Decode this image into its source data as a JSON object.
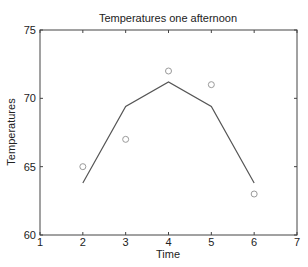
{
  "chart_data": {
    "type": "line",
    "title": "Temperatures one afternoon",
    "xlabel": "Time",
    "ylabel": "Temperatures",
    "xlim": [
      1,
      7
    ],
    "ylim": [
      60,
      75
    ],
    "xticks": [
      1,
      2,
      3,
      4,
      5,
      6,
      7
    ],
    "yticks": [
      60,
      65,
      70,
      75
    ],
    "grid": false,
    "legend": null,
    "series": [
      {
        "name": "observed",
        "style": "markers-circle",
        "color": "#9a9a9a",
        "x": [
          2,
          3,
          4,
          5,
          6
        ],
        "y": [
          65,
          67,
          72,
          71,
          63
        ]
      },
      {
        "name": "fit",
        "style": "line",
        "color": "#555555",
        "x": [
          2,
          3,
          4,
          5,
          6
        ],
        "y": [
          63.8,
          69.4,
          71.2,
          69.4,
          63.8
        ]
      }
    ]
  }
}
